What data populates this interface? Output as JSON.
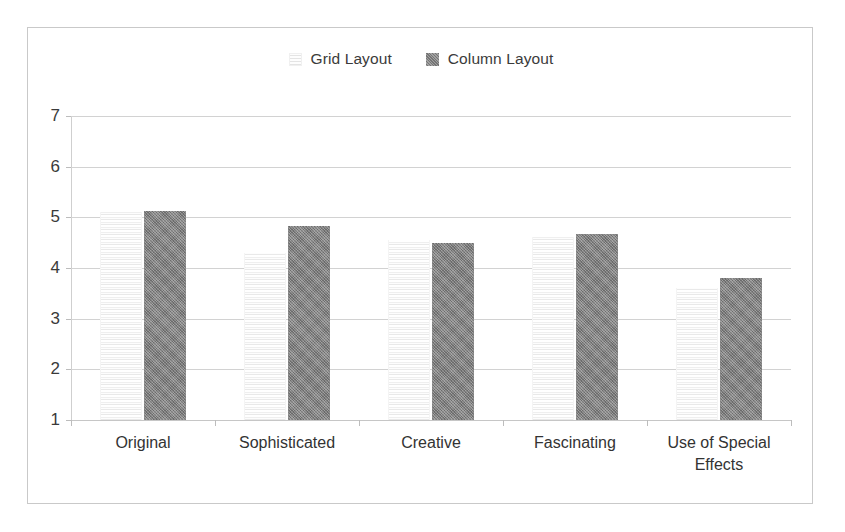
{
  "chart_data": {
    "type": "bar",
    "title": "",
    "subtitle": "",
    "xlabel": "",
    "ylabel": "",
    "categories": [
      "Original",
      "Sophisticated",
      "Creative",
      "Fascinating",
      "Use of Special Effects"
    ],
    "series": [
      {
        "name": "Grid Layout",
        "values": [
          5.1,
          4.3,
          4.55,
          4.62,
          3.6
        ]
      },
      {
        "name": "Column Layout",
        "values": [
          5.12,
          4.82,
          4.5,
          4.68,
          3.8
        ]
      }
    ],
    "ylim": [
      1,
      7
    ],
    "yticks": [
      1,
      2,
      3,
      4,
      5,
      6,
      7
    ],
    "ytick_labels": [
      "1",
      "2",
      "3",
      "4",
      "5",
      "6",
      "7"
    ],
    "grid": true,
    "grid_axis": "y",
    "legend": [
      "Grid Layout",
      "Column Layout"
    ],
    "legend_position": "top-center",
    "colors": {
      "grid_layout_bar": "#fcfcfc",
      "column_layout_bar": "#838383",
      "gridline": "#d2d2d2",
      "axis": "#c6c6c6",
      "text": "#333333",
      "frame": "#c9c9c9",
      "background": "#ffffff"
    }
  },
  "legend": {
    "items": [
      {
        "label": "Grid Layout",
        "swatch": "grid-layout-swatch"
      },
      {
        "label": "Column Layout",
        "swatch": "column-layout-swatch"
      }
    ]
  },
  "axes": {
    "y_labels": [
      "7",
      "6",
      "5",
      "4",
      "3",
      "2",
      "1"
    ],
    "x_labels": [
      "Original",
      "Sophisticated",
      "Creative",
      "Fascinating",
      "Use of Special Effects"
    ]
  }
}
